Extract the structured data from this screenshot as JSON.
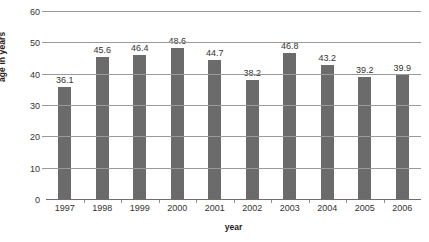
{
  "chart_data": {
    "type": "bar",
    "title": "",
    "xlabel": "year",
    "ylabel": "age in years",
    "categories": [
      "1997",
      "1998",
      "1999",
      "2000",
      "2001",
      "2002",
      "2003",
      "2004",
      "2005",
      "2006"
    ],
    "values": [
      36.1,
      45.6,
      46.4,
      48.6,
      44.7,
      38.2,
      46.8,
      43.2,
      39.2,
      39.9
    ],
    "value_labels": [
      "36.1",
      "45.6",
      "46.4",
      "48.6",
      "44.7",
      "38.2",
      "46.8",
      "43.2",
      "39.2",
      "39.9"
    ],
    "ylim": [
      0,
      60
    ],
    "yticks": [
      0,
      10,
      20,
      30,
      40,
      50,
      60
    ],
    "ytick_labels": [
      "0",
      "10",
      "20",
      "30",
      "40",
      "50",
      "60"
    ],
    "grid": true,
    "legend": false,
    "bar_color": "#6b6b6b",
    "gridline_color": "#9a9a9a",
    "background_color": "#ffffff"
  }
}
